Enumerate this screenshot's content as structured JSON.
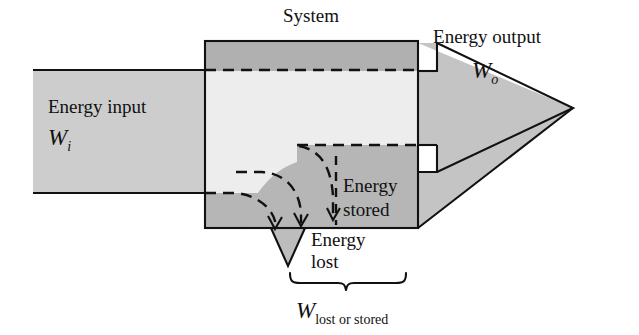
{
  "figure": {
    "title_label": "System",
    "input_label": "Energy input",
    "input_symbol": "W",
    "input_subscript": "i",
    "output_label": "Energy output",
    "output_symbol": "W",
    "output_subscript": "o",
    "stored_label_line1": "Energy",
    "stored_label_line2": "stored",
    "lost_label_line1": "Energy",
    "lost_label_line2": "lost",
    "brace_symbol": "W",
    "brace_subscript": "lost or stored"
  },
  "colors": {
    "background": "#ffffff",
    "stroke": "#111111",
    "input_band_fill": "#cdcdcd",
    "system_top_fill": "#b0b0b0",
    "system_interior_fill": "#ededed",
    "system_dark_fill": "#b6b6b6",
    "arrow_fill": "#c4c4c4",
    "lost_triangle_fill": "#bdbdbd"
  },
  "geometry": {
    "system_box": {
      "x": 205,
      "y": 41,
      "width": 213,
      "height": 187
    },
    "input_band": {
      "x": 33,
      "y": 70,
      "width": 172,
      "height": 123
    },
    "output_arrow_tip": {
      "x": 573,
      "y": 108
    },
    "lost_arrow_tip": {
      "x": 288,
      "y": 266
    },
    "brace": {
      "x1": 290,
      "x2": 405,
      "y": 277
    }
  }
}
